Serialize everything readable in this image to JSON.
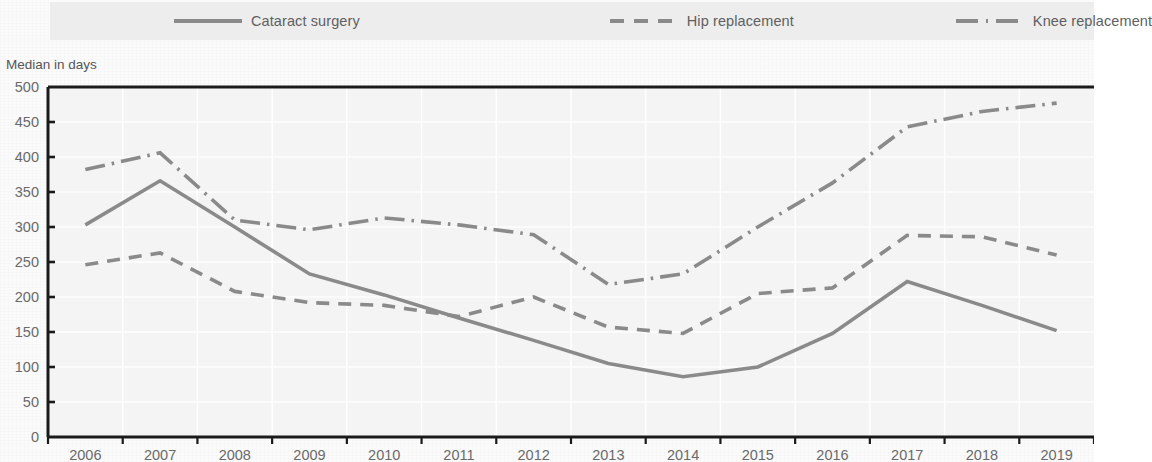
{
  "legend": {
    "items": [
      {
        "label": "Cataract surgery",
        "style": "solid",
        "color": "#8a8a8a",
        "icon": "line-solid-icon"
      },
      {
        "label": "Hip replacement",
        "style": "dashed",
        "color": "#8a8a8a",
        "icon": "line-dashed-icon"
      },
      {
        "label": "Knee replacement",
        "style": "dash-dot",
        "color": "#8a8a8a",
        "icon": "line-dash-dot-icon"
      }
    ]
  },
  "axis_title": "Median in days",
  "chart_data": {
    "type": "line",
    "title": "",
    "subtitle": "",
    "xlabel": "",
    "ylabel": "Median in days",
    "categories": [
      "2006",
      "2007",
      "2008",
      "2009",
      "2010",
      "2011",
      "2012",
      "2013",
      "2014",
      "2015",
      "2016",
      "2017",
      "2018",
      "2019"
    ],
    "x": [
      2006,
      2007,
      2008,
      2009,
      2010,
      2011,
      2012,
      2013,
      2014,
      2015,
      2016,
      2017,
      2018,
      2019
    ],
    "series": [
      {
        "name": "Cataract surgery",
        "style": "solid",
        "color": "#8a8a8a",
        "values": [
          303,
          366,
          300,
          233,
          203,
          170,
          138,
          105,
          86,
          100,
          148,
          222,
          188,
          152
        ]
      },
      {
        "name": "Hip replacement",
        "style": "dashed",
        "color": "#8a8a8a",
        "values": [
          246,
          263,
          208,
          192,
          188,
          172,
          200,
          157,
          148,
          205,
          213,
          288,
          286,
          260
        ]
      },
      {
        "name": "Knee replacement",
        "style": "dash-dot",
        "color": "#8a8a8a",
        "values": [
          382,
          406,
          310,
          296,
          313,
          303,
          289,
          218,
          233,
          300,
          363,
          443,
          465,
          477
        ]
      }
    ],
    "ylim": [
      0,
      500
    ],
    "ytick_labels": [
      "0",
      "50",
      "100",
      "150",
      "200",
      "250",
      "300",
      "350",
      "400",
      "450",
      "500"
    ],
    "yticks": [
      0,
      50,
      100,
      150,
      200,
      250,
      300,
      350,
      400,
      450,
      500
    ],
    "xtick_labels": [
      "2006",
      "2007",
      "2008",
      "2009",
      "2010",
      "2011",
      "2012",
      "2013",
      "2014",
      "2015",
      "2016",
      "2017",
      "2018",
      "2019"
    ],
    "grid": true,
    "grid_color": "#f2f2f2",
    "legend_position": "top",
    "plot_background": "#f4f4f4",
    "axis_color": "#1a1a1a"
  }
}
